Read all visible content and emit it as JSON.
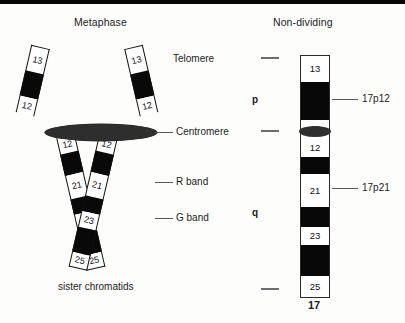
{
  "figure": {
    "panels": {
      "left_title": "Metaphase",
      "right_title": "Non-dividing"
    },
    "annotations": {
      "telomere": "Telomere",
      "centromere": "Centromere",
      "r_band": "R band",
      "g_band": "G band",
      "sister_chromatids": "sister chromatids"
    },
    "colors": {
      "g_band": "#080808",
      "r_band": "#ffffff",
      "centromere": "#2e2e2e",
      "outline": "#1a1a1a",
      "leader_line": "#55585c",
      "text": "#1c1c1c"
    }
  },
  "metaphase": {
    "left_chromatid": {
      "upper_arm_bands": [
        {
          "type": "R",
          "label": "13",
          "len": 26
        },
        {
          "type": "G",
          "label": "",
          "len": 26
        },
        {
          "type": "R",
          "label": "12",
          "len": 17
        }
      ],
      "lower_arm_bands": [
        {
          "type": "R",
          "label": "12",
          "len": 17
        },
        {
          "type": "G",
          "label": "",
          "len": 22
        },
        {
          "type": "R",
          "label": "21",
          "len": 24
        },
        {
          "type": "G",
          "label": "",
          "len": 16
        },
        {
          "type": "R",
          "label": "23",
          "len": 16
        },
        {
          "type": "G",
          "label": "",
          "len": 26
        },
        {
          "type": "R",
          "label": "25",
          "len": 15
        }
      ]
    },
    "right_chromatid": {
      "upper_arm_bands": [
        {
          "type": "R",
          "label": "13",
          "len": 26
        },
        {
          "type": "G",
          "label": "",
          "len": 26
        },
        {
          "type": "R",
          "label": "12",
          "len": 17
        }
      ],
      "lower_arm_bands": [
        {
          "type": "R",
          "label": "12",
          "len": 17
        },
        {
          "type": "G",
          "label": "",
          "len": 22
        },
        {
          "type": "R",
          "label": "21",
          "len": 24
        },
        {
          "type": "G",
          "label": "",
          "len": 16
        },
        {
          "type": "R",
          "label": "23",
          "len": 16
        },
        {
          "type": "G",
          "label": "",
          "len": 26
        },
        {
          "type": "R",
          "label": "25",
          "len": 15
        }
      ]
    }
  },
  "non_dividing": {
    "chromosome_number": "17",
    "arm_labels": {
      "short_arm": "p",
      "long_arm": "q"
    },
    "band_callouts": [
      {
        "label": "17p12",
        "target_band": "G band below 13"
      },
      {
        "label": "17p21",
        "target_band": "21"
      }
    ],
    "bands": [
      {
        "type": "R",
        "label": "13",
        "len": 27
      },
      {
        "type": "G",
        "label": "",
        "len": 38
      },
      {
        "type": "R",
        "label": "12",
        "len": 18
      },
      {
        "type": "R",
        "label": "12",
        "len": 19
      },
      {
        "type": "G",
        "label": "",
        "len": 17
      },
      {
        "type": "R",
        "label": "21",
        "len": 33
      },
      {
        "type": "G",
        "label": "",
        "len": 20
      },
      {
        "type": "R",
        "label": "23",
        "len": 18
      },
      {
        "type": "G",
        "label": "",
        "len": 31
      },
      {
        "type": "R",
        "label": "25",
        "len": 22
      }
    ]
  }
}
